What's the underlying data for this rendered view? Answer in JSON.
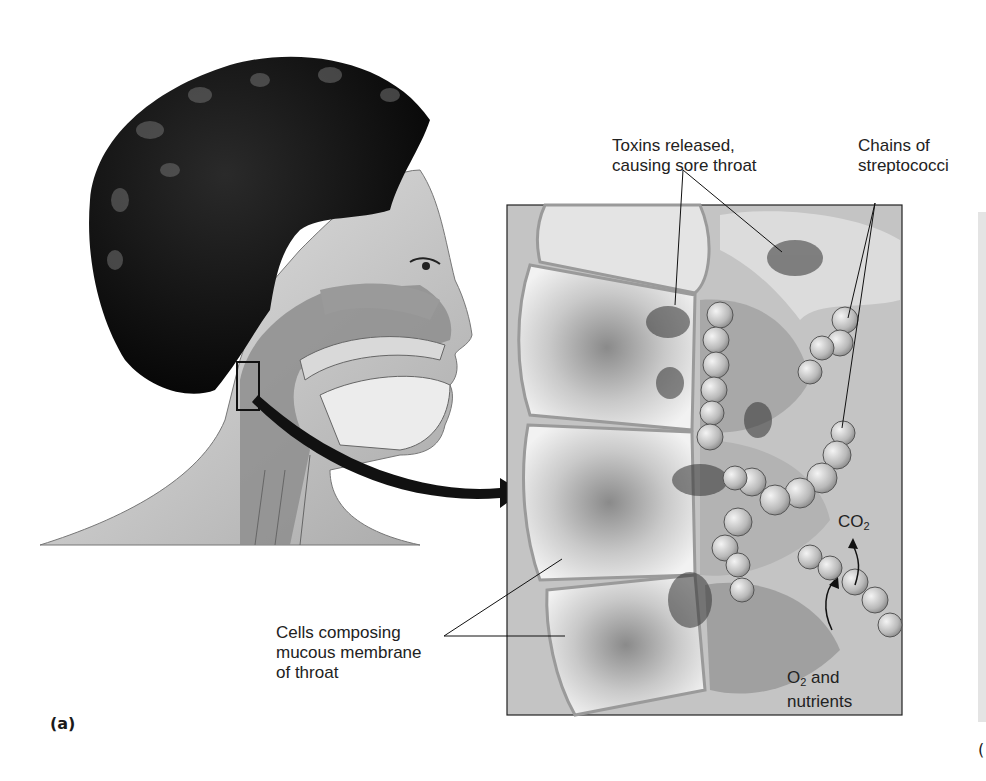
{
  "figure": {
    "panel_label": "(a)",
    "next_panel_label_fragment": "(",
    "labels": {
      "toxins": [
        "Toxins released,",
        "causing sore throat"
      ],
      "chains": [
        "Chains of",
        "streptococci"
      ],
      "cells": [
        "Cells composing",
        "mucous membrane",
        "of throat"
      ],
      "co2": {
        "base": "CO",
        "sub": "2"
      },
      "o2": {
        "base": "O",
        "sub": "2",
        "rest": " and",
        "line2": "nutrients"
      }
    },
    "regions": {
      "head": "Head profile with throat cross-section",
      "inset": "Magnified view of throat mucous membrane with streptococci"
    }
  }
}
